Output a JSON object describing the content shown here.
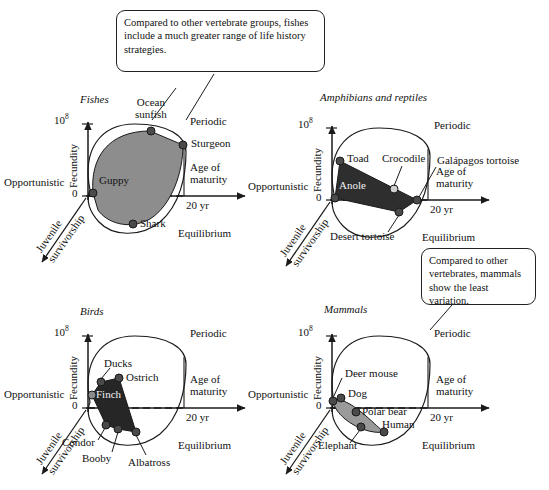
{
  "figure": {
    "axes_common": {
      "y_label": "Fecundity",
      "y_tick_top": "10",
      "y_tick_top_exponent": "8",
      "y_tick_zero": "0",
      "x_label_line1": "Age of",
      "x_label_line2": "maturity",
      "x_tick": "20 yr",
      "z_label_line1": "Juvenile",
      "z_label_line2": "survivorship",
      "corner_opportunistic": "Opportunistic",
      "corner_periodic": "Periodic",
      "corner_equilibrium": "Equilibrium"
    },
    "colors": {
      "fishes_fill": "#8d8d8d",
      "amphibians_fill": "#2e2e2e",
      "birds_fill": "#262626",
      "mammals_fill": "#9a9a9a",
      "stroke": "#1a1a1a",
      "point": "#4a4a4a",
      "background": "#ffffff"
    },
    "panels": [
      {
        "id": "fishes",
        "title": "Fishes",
        "fill": "#8d8d8d",
        "points": [
          {
            "name": "Guppy",
            "label_pos": "right"
          },
          {
            "name": "Ocean sunfish",
            "label_pos": "above"
          },
          {
            "name": "Sturgeon",
            "label_pos": "right"
          },
          {
            "name": "Shark",
            "label_pos": "right"
          }
        ]
      },
      {
        "id": "amphibians",
        "title": "Amphibians and reptiles",
        "fill": "#2e2e2e",
        "points": [
          {
            "name": "Toad",
            "label_pos": "right"
          },
          {
            "name": "Anole",
            "label_pos": "right"
          },
          {
            "name": "Crocodile",
            "label_pos": "above"
          },
          {
            "name": "Galápagos tortoise",
            "label_pos": "right"
          },
          {
            "name": "Desert tortoise",
            "label_pos": "below"
          }
        ]
      },
      {
        "id": "birds",
        "title": "Birds",
        "fill": "#262626",
        "points": [
          {
            "name": "Ducks",
            "label_pos": "above"
          },
          {
            "name": "Ostrich",
            "label_pos": "right"
          },
          {
            "name": "Finch",
            "label_pos": "right"
          },
          {
            "name": "Condor",
            "label_pos": "below"
          },
          {
            "name": "Booby",
            "label_pos": "below"
          },
          {
            "name": "Albatross",
            "label_pos": "below"
          }
        ]
      },
      {
        "id": "mammals",
        "title": "Mammals",
        "fill": "#9a9a9a",
        "points": [
          {
            "name": "Deer mouse",
            "label_pos": "above"
          },
          {
            "name": "Dog",
            "label_pos": "right"
          },
          {
            "name": "Polar bear",
            "label_pos": "right"
          },
          {
            "name": "Elephant",
            "label_pos": "below"
          },
          {
            "name": "Human",
            "label_pos": "right"
          }
        ]
      }
    ],
    "callouts": [
      {
        "id": "fishes-callout",
        "text": "Compared to other vertebrate groups, fishes include a much greater range of life history strategies."
      },
      {
        "id": "mammals-callout",
        "text": "Compared to other vertebrates, mammals show the least variation."
      }
    ]
  },
  "chart_data": {
    "type": "scatter",
    "xlabel": "Age of maturity",
    "ylabel": "Fecundity",
    "zlabel": "Juvenile survivorship",
    "axis_corners": [
      "Opportunistic",
      "Periodic",
      "Equilibrium"
    ],
    "ylim": [
      "0",
      "10^8"
    ],
    "x_tick_labels": [
      "20 yr"
    ],
    "grid": false,
    "legend": "none",
    "series": [
      {
        "name": "Fishes",
        "fill": "#8d8d8d",
        "points": [
          {
            "label": "Guppy",
            "age_of_maturity": 0.3,
            "fecundity": 0.06,
            "juvenile_survivorship": "low"
          },
          {
            "label": "Ocean sunfish",
            "age_of_maturity": 7.0,
            "fecundity": 0.86,
            "juvenile_survivorship": "low"
          },
          {
            "label": "Sturgeon",
            "age_of_maturity": 11.0,
            "fecundity": 0.68,
            "juvenile_survivorship": "low"
          },
          {
            "label": "Shark",
            "age_of_maturity": 5.0,
            "fecundity": -0.38,
            "juvenile_survivorship": "high"
          }
        ]
      },
      {
        "name": "Amphibians and reptiles",
        "fill": "#2e2e2e",
        "points": [
          {
            "label": "Toad",
            "age_of_maturity": 0.9,
            "fecundity": 0.5,
            "juvenile_survivorship": "low"
          },
          {
            "label": "Anole",
            "age_of_maturity": 0.3,
            "fecundity": 0.03,
            "juvenile_survivorship": "low"
          },
          {
            "label": "Crocodile",
            "age_of_maturity": 7.5,
            "fecundity": 0.13,
            "juvenile_survivorship": "medium"
          },
          {
            "label": "Galápagos tortoise",
            "age_of_maturity": 11.0,
            "fecundity": 0.0,
            "juvenile_survivorship": "high"
          },
          {
            "label": "Desert tortoise",
            "age_of_maturity": 8.5,
            "fecundity": -0.16,
            "juvenile_survivorship": "high"
          }
        ]
      },
      {
        "name": "Birds",
        "fill": "#262626",
        "points": [
          {
            "label": "Ducks",
            "age_of_maturity": 1.6,
            "fecundity": 0.34,
            "juvenile_survivorship": "low"
          },
          {
            "label": "Ostrich",
            "age_of_maturity": 4.0,
            "fecundity": 0.39,
            "juvenile_survivorship": "low"
          },
          {
            "label": "Finch",
            "age_of_maturity": 0.4,
            "fecundity": 0.17,
            "juvenile_survivorship": "low"
          },
          {
            "label": "Condor",
            "age_of_maturity": 2.3,
            "fecundity": -0.22,
            "juvenile_survivorship": "high"
          },
          {
            "label": "Booby",
            "age_of_maturity": 3.6,
            "fecundity": -0.28,
            "juvenile_survivorship": "high"
          },
          {
            "label": "Albatross",
            "age_of_maturity": 5.8,
            "fecundity": -0.32,
            "juvenile_survivorship": "high"
          }
        ]
      },
      {
        "name": "Mammals",
        "fill": "#9a9a9a",
        "points": [
          {
            "label": "Deer mouse",
            "age_of_maturity": 0.2,
            "fecundity": 0.09,
            "juvenile_survivorship": "low"
          },
          {
            "label": "Dog",
            "age_of_maturity": 1.2,
            "fecundity": 0.13,
            "juvenile_survivorship": "low"
          },
          {
            "label": "Polar bear",
            "age_of_maturity": 3.4,
            "fecundity": -0.05,
            "juvenile_survivorship": "medium"
          },
          {
            "label": "Elephant",
            "age_of_maturity": 4.1,
            "fecundity": -0.24,
            "juvenile_survivorship": "high"
          },
          {
            "label": "Human",
            "age_of_maturity": 7.2,
            "fecundity": -0.3,
            "juvenile_survivorship": "high"
          }
        ]
      }
    ],
    "annotations": [
      "Compared to other vertebrate groups, fishes include a much greater range of life history strategies.",
      "Compared to other vertebrates, mammals show the least variation."
    ]
  }
}
